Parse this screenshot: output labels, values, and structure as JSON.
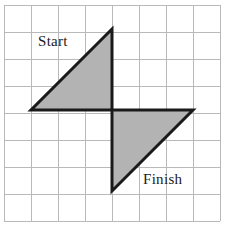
{
  "figure": {
    "background_color": "#ffffff",
    "grid": {
      "columns": 8,
      "rows": 8,
      "cell_size_px": 27,
      "origin_x_px": 4,
      "origin_y_px": 5,
      "line_color": "#b9b9b9",
      "line_width_px": 1
    },
    "shape_style": {
      "fill_color": "#b3b3b3",
      "outline_color": "#1a1a1a",
      "outline_width_px": 3
    },
    "labels": {
      "start": "Start",
      "finish": "Finish"
    },
    "label_positions": {
      "start": {
        "x": 38,
        "y": 46
      },
      "finish": {
        "x": 143,
        "y": 184
      }
    },
    "shapes": [
      {
        "name": "start-triangle",
        "label": "Start",
        "points": "31,110 112,110 112,29",
        "vertices_grid": [
          [
            1,
            4
          ],
          [
            4,
            4
          ],
          [
            4,
            1
          ]
        ],
        "legs_cells": 3,
        "right_angle_vertex_grid": [
          4,
          4
        ]
      },
      {
        "name": "finish-triangle",
        "label": "Finish",
        "points": "112,110 193,110 112,191",
        "vertices_grid": [
          [
            4,
            4
          ],
          [
            7,
            4
          ],
          [
            4,
            7
          ]
        ],
        "legs_cells": 3,
        "right_angle_vertex_grid": [
          4,
          4
        ]
      }
    ]
  }
}
